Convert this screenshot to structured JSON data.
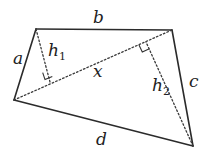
{
  "diagram": {
    "type": "quadrilateral",
    "vertices": {
      "top_left": [
        36,
        29
      ],
      "top_right": [
        172,
        30
      ],
      "bottom_right": [
        193,
        146
      ],
      "left": [
        14,
        100
      ]
    },
    "sides": {
      "a": "a",
      "b": "b",
      "c": "c",
      "d": "d"
    },
    "diagonal": {
      "label": "x"
    },
    "heights": {
      "h1": {
        "base": "h",
        "subscript": "1"
      },
      "h2": {
        "base": "h",
        "subscript": "2"
      }
    },
    "colors": {
      "stroke": "#2b2b2b",
      "background": "#ffffff"
    }
  }
}
